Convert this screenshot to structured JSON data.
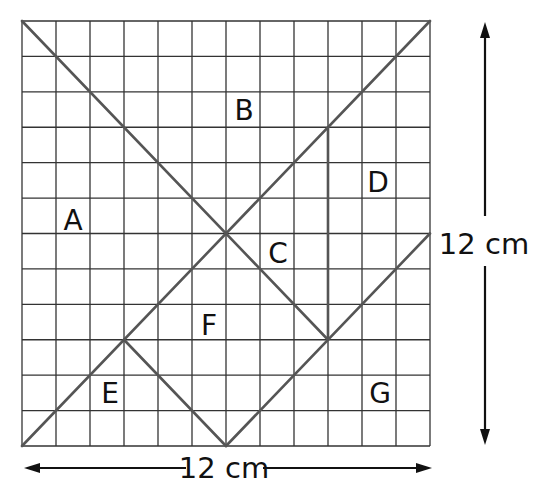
{
  "diagram": {
    "grid": {
      "cols": 12,
      "rows": 12,
      "left": 22,
      "top": 21,
      "right": 430,
      "bottom": 446,
      "line_color": "#333333",
      "cut_color": "#555555"
    },
    "cut_lines": [
      {
        "from": [
          0,
          0
        ],
        "to": [
          9,
          9
        ]
      },
      {
        "from": [
          0,
          12
        ],
        "to": [
          12,
          0
        ]
      },
      {
        "from": [
          9,
          3
        ],
        "to": [
          9,
          9
        ]
      },
      {
        "from": [
          12,
          6
        ],
        "to": [
          6,
          12
        ]
      },
      {
        "from": [
          3,
          9
        ],
        "to": [
          6,
          12
        ]
      }
    ],
    "pieces": [
      {
        "label": "A",
        "x": 73,
        "y": 220
      },
      {
        "label": "B",
        "x": 244,
        "y": 110
      },
      {
        "label": "C",
        "x": 278,
        "y": 253
      },
      {
        "label": "D",
        "x": 378,
        "y": 182
      },
      {
        "label": "E",
        "x": 110,
        "y": 393
      },
      {
        "label": "F",
        "x": 209,
        "y": 325
      },
      {
        "label": "G",
        "x": 380,
        "y": 393
      }
    ],
    "width_label": "12 cm",
    "height_label": "12 cm"
  }
}
